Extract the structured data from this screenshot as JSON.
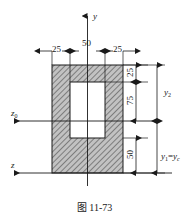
{
  "figure": {
    "caption": "图 11-73",
    "axes": [
      {
        "id": "y-axis",
        "label": "y",
        "orientation": "vertical-up",
        "arrow": "up"
      },
      {
        "id": "z0-axis",
        "label": "z",
        "sub": "0",
        "orientation": "horizontal-left",
        "arrow": "left"
      },
      {
        "id": "z-axis",
        "label": "z",
        "sub": "",
        "orientation": "horizontal-left",
        "arrow": "left"
      }
    ],
    "horizontal_dimensions": [
      {
        "id": "left-flange-width",
        "value": "25"
      },
      {
        "id": "central-opening-width",
        "value": "50"
      },
      {
        "id": "right-flange-width",
        "value": "25"
      }
    ],
    "vertical_dimensions": [
      {
        "id": "top-cover-depth",
        "value": "25"
      },
      {
        "id": "opening-upper-depth",
        "value": "75"
      },
      {
        "id": "lower-depth",
        "value": "50"
      }
    ],
    "centroid_labels": [
      {
        "id": "y2-label",
        "base": "y",
        "sub": "2",
        "text": "y₂"
      },
      {
        "id": "y1-yc-label",
        "base": "y",
        "sub": "1",
        "eq": "=",
        "base2": "y",
        "sub2": "c",
        "text": "y₁=y_c"
      }
    ],
    "shape": {
      "outer": {
        "name": "hatched-rectangle",
        "hatch": "diagonal-45"
      },
      "inner": {
        "name": "white-opening-rectangle"
      }
    },
    "colors": {
      "line": "#1a1a1a",
      "hatch": "#6e6e6e",
      "hatch_fill": "#b9b9b9",
      "opening": "#ffffff",
      "background": "#ffffff"
    }
  }
}
